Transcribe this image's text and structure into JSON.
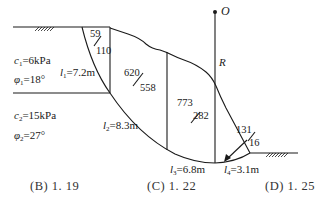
{
  "diagram": {
    "type": "slope-stability-slice-diagram",
    "center_label": "O",
    "radius_label": "R",
    "layer1": {
      "c_sym": "c",
      "c_sub": "1",
      "c_val": "=6kPa",
      "phi_sym": "φ",
      "phi_sub": "1",
      "phi_val": "=18°"
    },
    "layer2": {
      "c_sym": "c",
      "c_sub": "2",
      "c_val": "=15kPa",
      "phi_sym": "φ",
      "phi_sub": "2",
      "phi_val": "=27°"
    },
    "lengths": [
      {
        "sym": "l",
        "sub": "1",
        "val": "=7.2m"
      },
      {
        "sym": "l",
        "sub": "2",
        "val": "=8.3m"
      },
      {
        "sym": "l",
        "sub": "3",
        "val": "=6.8m"
      },
      {
        "sym": "l",
        "sub": "4",
        "val": "=3.1m"
      }
    ],
    "slices": [
      {
        "top": "59",
        "bottom": "110"
      },
      {
        "top": "620",
        "bottom": "558"
      },
      {
        "top": "773",
        "bottom": "282"
      },
      {
        "top": "131",
        "bottom": "16"
      }
    ]
  },
  "options": [
    {
      "label": "(B) 1. 19"
    },
    {
      "label": "(C) 1. 22"
    },
    {
      "label": "(D) 1. 25"
    }
  ]
}
